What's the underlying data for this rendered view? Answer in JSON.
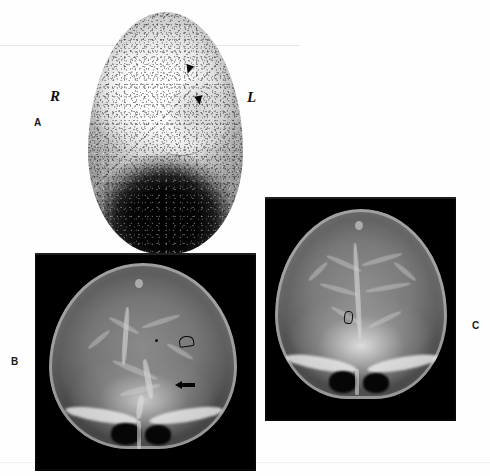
{
  "figure": {
    "background_color": "#fefefe",
    "panel_letters": {
      "a": "A",
      "b": "B",
      "c": "C"
    }
  },
  "panels": [
    {
      "id": "a",
      "letter": "A",
      "modality": "radionuclide brain scan",
      "view": "anterior",
      "background_color": "#ffffff",
      "orientation_markers": {
        "right": "R",
        "left": "L"
      },
      "annotations": [
        {
          "type": "solid-arrowhead",
          "index": 1
        },
        {
          "type": "solid-arrowhead",
          "index": 2
        }
      ]
    },
    {
      "id": "b",
      "letter": "B",
      "modality": "cerebral angiogram",
      "view": "anteroposterior",
      "background_color": "#000000",
      "annotations": [
        {
          "type": "open-arrow",
          "index": 1
        },
        {
          "type": "solid-arrow",
          "index": 1
        }
      ]
    },
    {
      "id": "c",
      "letter": "C",
      "modality": "cerebral angiogram",
      "view": "anteroposterior venous phase",
      "background_color": "#000000",
      "annotations": [
        {
          "type": "open-arrow",
          "index": 1
        }
      ]
    }
  ]
}
